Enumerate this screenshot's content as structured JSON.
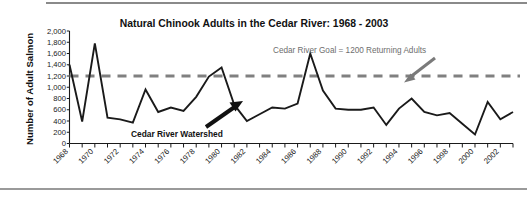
{
  "chart_data": {
    "type": "line",
    "title": "Natural Chinook Adults in the Cedar River: 1968 - 2003",
    "xlabel": "",
    "ylabel": "Number of Adult Salmon",
    "ylim": [
      0,
      2000
    ],
    "xlim": [
      1968,
      2003
    ],
    "grid": false,
    "legend": "none",
    "y_ticks": [
      "0",
      "200",
      "400",
      "600",
      "800",
      "1,000",
      "1,200",
      "1,400",
      "1,600",
      "1,800",
      "2,000"
    ],
    "y_tick_values": [
      0,
      200,
      400,
      600,
      800,
      1000,
      1200,
      1400,
      1600,
      1800,
      2000
    ],
    "x_tick_labels": [
      "1968",
      "1970",
      "1972",
      "1974",
      "1976",
      "1978",
      "1980",
      "1982",
      "1984",
      "1986",
      "1988",
      "1990",
      "1992",
      "1994",
      "1996",
      "1998",
      "2000",
      "2002"
    ],
    "x": [
      1968,
      1969,
      1970,
      1971,
      1972,
      1973,
      1974,
      1975,
      1976,
      1977,
      1978,
      1979,
      1980,
      1981,
      1982,
      1983,
      1984,
      1985,
      1986,
      1987,
      1988,
      1989,
      1990,
      1991,
      1992,
      1993,
      1994,
      1995,
      1996,
      1997,
      1998,
      1999,
      2000,
      2001,
      2002,
      2003
    ],
    "series": [
      {
        "name": "Natural Chinook Adults",
        "color": "#1a1a1a",
        "values": [
          1400,
          390,
          1780,
          460,
          430,
          370,
          960,
          560,
          640,
          580,
          830,
          1190,
          1350,
          690,
          400,
          520,
          640,
          620,
          710,
          1600,
          940,
          620,
          600,
          600,
          640,
          330,
          620,
          800,
          560,
          500,
          540,
          350,
          160,
          740,
          430,
          560
        ]
      }
    ],
    "reference_line": {
      "label": "Cedar River Goal = 1200 Returning Adults",
      "value": 1200,
      "color": "#808080",
      "style": "dashed"
    },
    "annotations": [
      {
        "name": "cedar-river-watershed",
        "text": "Cedar River Watershed",
        "color": "#111111"
      },
      {
        "name": "cedar-river-goal",
        "text": "Cedar River Goal = 1200 Returning Adults",
        "color": "#6e6e6e"
      }
    ]
  }
}
